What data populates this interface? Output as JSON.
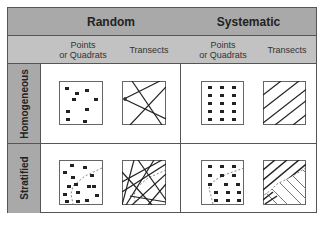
{
  "header": {
    "groups": [
      {
        "label": "Random"
      },
      {
        "label": "Systematic"
      }
    ],
    "subcolumns": [
      {
        "label": "Points\nor Quadrats",
        "line1": "Points",
        "line2": "or Quadrats"
      },
      {
        "label": "Transects"
      },
      {
        "label": "Points\nor Quadrats",
        "line1": "Points",
        "line2": "or Quadrats"
      },
      {
        "label": "Transects"
      }
    ]
  },
  "rows": [
    {
      "label": "Homogeneous"
    },
    {
      "label": "Stratified"
    }
  ],
  "colors": {
    "header_dark": "#a9a9a9",
    "header_light": "#c2c2c2",
    "border": "#555555",
    "ink": "#222222"
  }
}
